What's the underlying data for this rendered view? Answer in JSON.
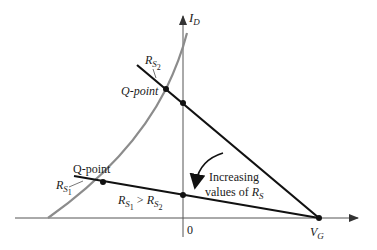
{
  "diagram": {
    "axes": {
      "y_label_main": "I",
      "y_label_sub": "D",
      "x_label_main": "V",
      "x_label_sub": "G",
      "origin_label": "0"
    },
    "load_lines": [
      {
        "name": "R_S2",
        "label_main": "R",
        "label_sub": "S",
        "label_subsub": "2",
        "q_point_label": "Q-point"
      },
      {
        "name": "R_S1",
        "label_main": "R",
        "label_sub": "S",
        "label_subsub": "1",
        "q_point_label": "Q-point"
      }
    ],
    "relation": {
      "left_main": "R",
      "left_sub": "S",
      "left_subsub": "1",
      "op": " > ",
      "right_main": "R",
      "right_sub": "S",
      "right_subsub": "2"
    },
    "annotation": {
      "line1": "Increasing",
      "line2": "values of ",
      "line2_var": "R",
      "line2_sub": "S"
    },
    "colors": {
      "transfer_curve": "#8c8c8c",
      "load_line": "#111111",
      "axis": "#555555"
    }
  }
}
